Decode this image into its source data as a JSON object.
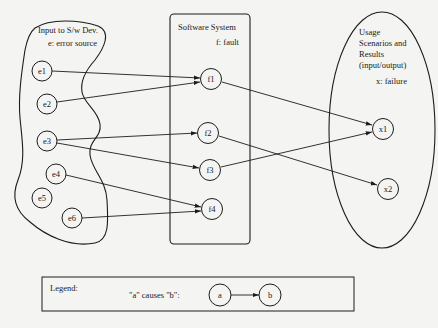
{
  "regions": {
    "input": {
      "title": "Input to S/w Dev.",
      "subtitle": "e: error source"
    },
    "software": {
      "title": "Software System",
      "subtitle": "f: fault"
    },
    "usage": {
      "title_lines": [
        "Usage",
        "Scenarios and",
        "Results",
        "(input/output)"
      ],
      "subtitle": "x: failure"
    }
  },
  "nodes": {
    "e1": {
      "label": "e1",
      "x": 42,
      "y": 71
    },
    "e2": {
      "label": "e2",
      "x": 47,
      "y": 104
    },
    "e3": {
      "label": "e3",
      "x": 47,
      "y": 141
    },
    "e4": {
      "label": "e4",
      "x": 56,
      "y": 174
    },
    "e5": {
      "label": "e5",
      "x": 42,
      "y": 198
    },
    "e6": {
      "label": "e6",
      "x": 72,
      "y": 218
    },
    "f1": {
      "label": "f1",
      "x": 211,
      "y": 79
    },
    "f2": {
      "label": "f2",
      "x": 208,
      "y": 133
    },
    "f3": {
      "label": "f3",
      "x": 210,
      "y": 170
    },
    "f4": {
      "label": "f4",
      "x": 212,
      "y": 209
    },
    "x1": {
      "label": "x1",
      "x": 383,
      "y": 129
    },
    "x2": {
      "label": "x2",
      "x": 388,
      "y": 189
    }
  },
  "edges": [
    {
      "from": "e1",
      "to": "f1"
    },
    {
      "from": "e2",
      "to": "f1"
    },
    {
      "from": "e3",
      "to": "f2"
    },
    {
      "from": "e3",
      "to": "f3"
    },
    {
      "from": "e4",
      "to": "f4"
    },
    {
      "from": "e6",
      "to": "f4"
    },
    {
      "from": "f1",
      "to": "x1"
    },
    {
      "from": "f2",
      "to": "x2"
    },
    {
      "from": "f3",
      "to": "x1"
    }
  ],
  "legend": {
    "title": "Legend:",
    "description": "\"a\" causes \"b\":",
    "node_a": "a",
    "node_b": "b"
  }
}
